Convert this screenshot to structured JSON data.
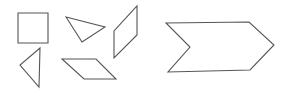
{
  "diagram": {
    "stroke_color": "#555555",
    "background": "#ffffff",
    "stroke_width": 1.1,
    "shapes": [
      {
        "id": "square",
        "type": "square",
        "points": [
          [
            18,
            13
          ],
          [
            48,
            13
          ],
          [
            48,
            43
          ],
          [
            18,
            43
          ]
        ]
      },
      {
        "id": "triangle-top",
        "type": "triangle",
        "points": [
          [
            66,
            17
          ],
          [
            105,
            27
          ],
          [
            82,
            42
          ]
        ]
      },
      {
        "id": "rhombus-right",
        "type": "parallelogram",
        "points": [
          [
            137,
            6
          ],
          [
            137,
            35
          ],
          [
            114,
            58
          ],
          [
            114,
            31
          ]
        ]
      },
      {
        "id": "triangle-left",
        "type": "triangle",
        "points": [
          [
            40,
            48
          ],
          [
            20,
            65
          ],
          [
            39,
            87
          ]
        ]
      },
      {
        "id": "parallelogram-bottom",
        "type": "parallelogram",
        "points": [
          [
            62,
            59
          ],
          [
            96,
            59
          ],
          [
            116,
            79
          ],
          [
            84,
            79
          ]
        ]
      },
      {
        "id": "chevron-arrow",
        "type": "hexagon-chevron",
        "points": [
          [
            166,
            23
          ],
          [
            249,
            22
          ],
          [
            274,
            45
          ],
          [
            250,
            70
          ],
          [
            168,
            72
          ],
          [
            190,
            47
          ]
        ]
      }
    ]
  }
}
